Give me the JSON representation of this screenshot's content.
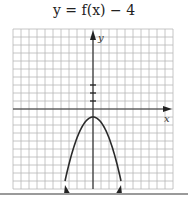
{
  "title": "y = f(x) − 4",
  "chart_data": {
    "type": "line",
    "title": "y = f(x) − 4",
    "xlabel": "x",
    "ylabel": "y",
    "xlim": [
      -10,
      10
    ],
    "ylim": [
      -10,
      10
    ],
    "grid": true,
    "grid_step": 1,
    "y_axis_ticks_marked": [
      1,
      2,
      3
    ],
    "series": [
      {
        "name": "y = f(x) − 4",
        "shape": "downward parabola with arrows at both ends",
        "vertex": [
          0,
          -1
        ],
        "x": [
          -3.5,
          -3,
          -2,
          -1,
          0,
          1,
          2,
          3,
          3.5
        ],
        "y": [
          -9,
          -6.9,
          -3.6,
          -1.65,
          -1,
          -1.65,
          -3.6,
          -6.9,
          -9
        ]
      }
    ],
    "legend": null
  },
  "colors": {
    "grid": "#b8b8b8",
    "axis": "#333333",
    "curve": "#2a2a2a",
    "separator": "#9a9a9a"
  }
}
